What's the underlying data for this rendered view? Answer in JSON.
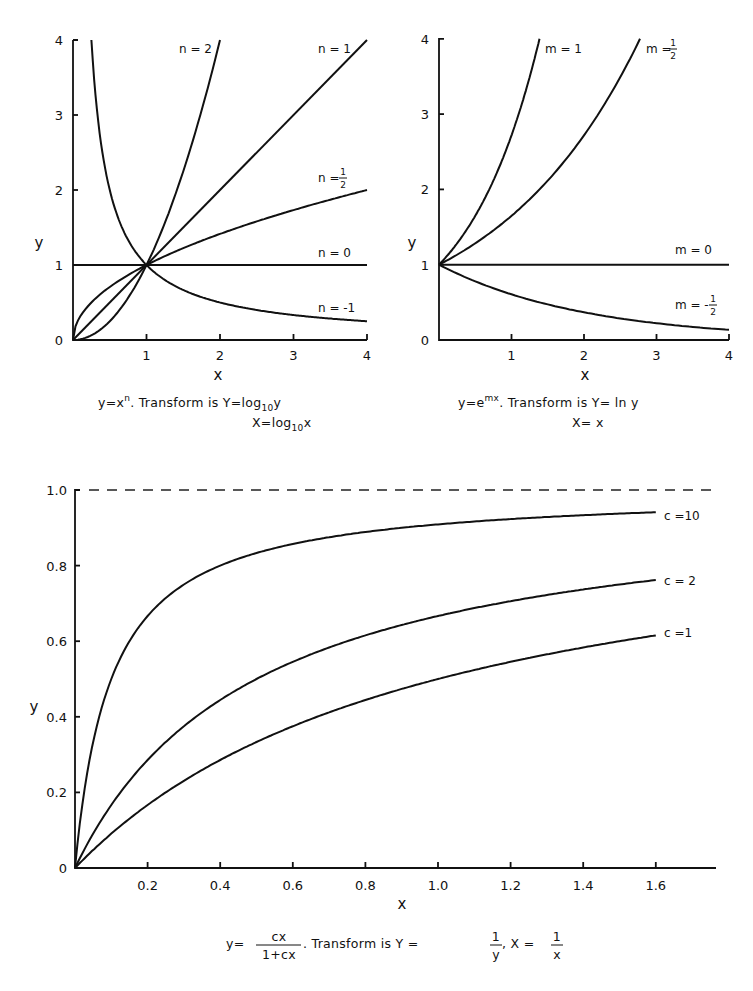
{
  "chart_data": [
    {
      "id": "power",
      "type": "line",
      "title": "",
      "xlabel": "x",
      "ylabel": "y",
      "xlim": [
        0,
        4
      ],
      "ylim": [
        0,
        4
      ],
      "xticks": [
        "1",
        "2",
        "3",
        "4"
      ],
      "yticks": [
        "0",
        "1",
        "2",
        "3",
        "4"
      ],
      "grid": false,
      "equation": "y = x^n",
      "caption_line1": {
        "lhs": "y=x",
        "sup": "n",
        "mid": ". Transform is  Y=log",
        "sub": "10",
        "end": "y"
      },
      "caption_line2": {
        "lhs": "X=log",
        "sub": "10",
        "end": "x"
      },
      "series": [
        {
          "name": "n = 2",
          "label": "n = 2",
          "n": 2,
          "x": [
            0,
            0.5,
            1,
            1.5,
            2
          ],
          "y": [
            0,
            0.25,
            1,
            2.25,
            4
          ]
        },
        {
          "name": "n = 1",
          "label": "n = 1",
          "n": 1,
          "x": [
            0,
            1,
            2,
            3,
            4
          ],
          "y": [
            0,
            1,
            2,
            3,
            4
          ]
        },
        {
          "name": "n = 1/2",
          "label": "n =",
          "label_frac": [
            "1",
            "2"
          ],
          "n": 0.5,
          "x": [
            0,
            0.25,
            1,
            2,
            3,
            4
          ],
          "y": [
            0,
            0.5,
            1,
            1.41,
            1.73,
            2
          ]
        },
        {
          "name": "n = 0",
          "label": "n = 0",
          "n": 0,
          "x": [
            0,
            4
          ],
          "y": [
            1,
            1
          ]
        },
        {
          "name": "n = -1",
          "label": "n = -1",
          "n": -1,
          "x": [
            0.25,
            0.5,
            1,
            2,
            3,
            4
          ],
          "y": [
            4,
            2,
            1,
            0.5,
            0.33,
            0.25
          ]
        }
      ]
    },
    {
      "id": "exponential",
      "type": "line",
      "title": "",
      "xlabel": "x",
      "ylabel": "y",
      "xlim": [
        0,
        4
      ],
      "ylim": [
        0,
        4
      ],
      "xticks": [
        "1",
        "2",
        "3",
        "4"
      ],
      "yticks": [
        "0",
        "1",
        "2",
        "3",
        "4"
      ],
      "grid": false,
      "equation": "y = e^(mx)",
      "caption_line1": {
        "lhs": "y=e",
        "sup": "mx",
        "mid": ". Transform is  Y= ln   y"
      },
      "caption_line2": {
        "lhs": "X= x"
      },
      "series": [
        {
          "name": "m = 1",
          "label": "m = 1",
          "m": 1,
          "x": [
            0,
            0.5,
            1,
            1.386
          ],
          "y": [
            1,
            1.65,
            2.72,
            4
          ]
        },
        {
          "name": "m = 1/2",
          "label": "m =",
          "label_frac": [
            "1",
            "2"
          ],
          "m": 0.5,
          "x": [
            0,
            1,
            2,
            2.77
          ],
          "y": [
            1,
            1.65,
            2.72,
            4
          ]
        },
        {
          "name": "m = 0",
          "label": "m = 0",
          "m": 0,
          "x": [
            0,
            4
          ],
          "y": [
            1,
            1
          ]
        },
        {
          "name": "m = -1/2",
          "label": "m = -",
          "label_frac": [
            "1",
            "2"
          ],
          "m": -0.5,
          "x": [
            0,
            1,
            2,
            3,
            4
          ],
          "y": [
            1,
            0.61,
            0.37,
            0.22,
            0.14
          ]
        }
      ]
    },
    {
      "id": "hyperbolic",
      "type": "line",
      "title": "",
      "xlabel": "x",
      "ylabel": "y",
      "xlim": [
        0,
        1.75
      ],
      "ylim": [
        0,
        1.0
      ],
      "xticks": [
        "0.2",
        "0.4",
        "0.6",
        "0.8",
        "1.0",
        "1.2",
        "1.4",
        "1.6"
      ],
      "yticks": [
        "0",
        "0.2",
        "0.4",
        "0.6",
        "0.8",
        "1.0"
      ],
      "grid": false,
      "asymptote": {
        "y": 1.0,
        "style": "dashed"
      },
      "equation": "y = cx / (1 + cx)",
      "caption": {
        "lhs": "y=",
        "num": "cx",
        "den": "1+cx",
        "mid": ". Transform is  Y =",
        "f1num": "1",
        "f1den": "y",
        "sep": ",  X =",
        "f2num": "1",
        "f2den": "x"
      },
      "series": [
        {
          "name": "c = 10",
          "label": "c =10",
          "c": 10,
          "x": [
            0,
            0.1,
            0.2,
            0.4,
            0.8,
            1.2,
            1.6
          ],
          "y": [
            0,
            0.5,
            0.667,
            0.8,
            0.889,
            0.923,
            0.941
          ]
        },
        {
          "name": "c = 2",
          "label": "c = 2",
          "c": 2,
          "x": [
            0,
            0.2,
            0.4,
            0.8,
            1.2,
            1.6
          ],
          "y": [
            0,
            0.286,
            0.444,
            0.615,
            0.706,
            0.762
          ]
        },
        {
          "name": "c = 1",
          "label": "c =1",
          "c": 1,
          "x": [
            0,
            0.2,
            0.4,
            0.8,
            1.2,
            1.6
          ],
          "y": [
            0,
            0.167,
            0.286,
            0.444,
            0.545,
            0.615
          ]
        }
      ]
    }
  ]
}
